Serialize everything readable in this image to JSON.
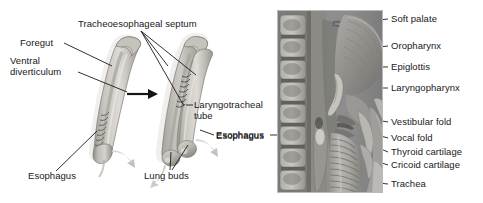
{
  "figure": {
    "background_color": "#ffffff",
    "label_color": "#18181a"
  },
  "left_panel": {
    "name": "embryonic-foregut-development",
    "labels": {
      "tracheoesophageal_septum": "Tracheoesophageal septum",
      "foregut": "Foregut",
      "ventral_diverticulum": "Ventral\ndiverticulum",
      "laryngotracheal_tube": "Laryngotracheal\ntube",
      "esophagus_right": "Esophagus",
      "esophagus_left": "Esophagus",
      "lung_buds": "Lung buds"
    },
    "arrow": "transition-arrow"
  },
  "right_panel": {
    "name": "sagittal-section-photograph",
    "labels": {
      "soft_palate": "Soft palate",
      "oropharynx": "Oropharynx",
      "epiglottis": "Epiglottis",
      "laryngopharynx": "Laryngopharynx",
      "vestibular_fold": "Vestibular fold",
      "vocal_fold": "Vocal fold",
      "thyroid_cartilage": "Thyroid cartilage",
      "cricoid_cartilage": "Cricoid cartilage",
      "trachea": "Trachea",
      "esophagus": "Esophagus"
    }
  },
  "colors": {
    "tissue_light": "#d8d6d2",
    "tissue_mid": "#b3b0aa",
    "tissue_dark": "#8e8b85",
    "outline": "#6f6c67",
    "photo_base": "#9a9a9a",
    "leader_line": "#1a1a1a"
  }
}
